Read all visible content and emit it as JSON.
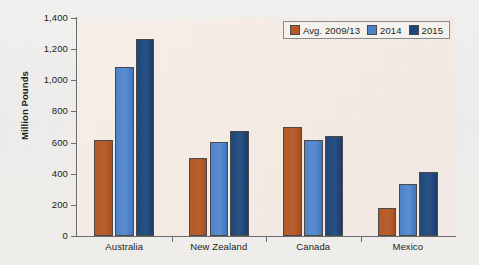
{
  "chart_data": {
    "type": "bar",
    "title": "",
    "subtitle": "",
    "xlabel": "",
    "ylabel": "Million Pounds",
    "categories": [
      "Australia",
      "New Zealand",
      "Canada",
      "Mexico"
    ],
    "series": [
      {
        "name": "Avg. 2009/13",
        "color": "#b55a26",
        "values": [
          618,
          500,
          702,
          182
        ]
      },
      {
        "name": "2014",
        "color": "#4c84ca",
        "values": [
          1085,
          605,
          618,
          332
        ]
      },
      {
        "name": "2015",
        "color": "#1f4779",
        "values": [
          1263,
          672,
          645,
          414
        ]
      }
    ],
    "ylim": [
      0,
      1400
    ],
    "yticks": [
      0,
      200,
      400,
      600,
      800,
      1000,
      1200,
      1400
    ],
    "ytick_labels": [
      "0",
      "200",
      "400",
      "600",
      "800",
      "1,000",
      "1,200",
      "1,400"
    ],
    "grid": false,
    "legend_position": "top-right",
    "plot_background": "#f7efe9",
    "figure_background": "#f0efec",
    "axis_color": "#6b6b6b"
  },
  "legend": {
    "items": [
      {
        "label": "Avg. 2009/13"
      },
      {
        "label": "2014"
      },
      {
        "label": "2015"
      }
    ]
  },
  "axes": {
    "y_title": "Million Pounds"
  }
}
